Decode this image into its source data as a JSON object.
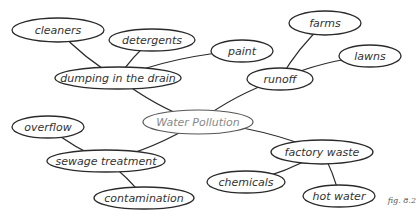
{
  "diagram": {
    "type": "mind-map",
    "center": {
      "id": "water-pollution",
      "label": "Water Pollution",
      "x": 198,
      "y": 122,
      "w": 110,
      "h": 24
    },
    "nodes": [
      {
        "id": "dumping",
        "label": "dumping in the drain",
        "x": 118,
        "y": 78,
        "w": 126,
        "h": 22
      },
      {
        "id": "cleaners",
        "label": "cleaners",
        "x": 58,
        "y": 30,
        "w": 92,
        "h": 24
      },
      {
        "id": "detergents",
        "label": "detergents",
        "x": 152,
        "y": 40,
        "w": 86,
        "h": 22
      },
      {
        "id": "paint",
        "label": "paint",
        "x": 242,
        "y": 51,
        "w": 62,
        "h": 22
      },
      {
        "id": "runoff",
        "label": "runoff",
        "x": 280,
        "y": 79,
        "w": 66,
        "h": 22
      },
      {
        "id": "farms",
        "label": "farms",
        "x": 325,
        "y": 23,
        "w": 72,
        "h": 24
      },
      {
        "id": "lawns",
        "label": "lawns",
        "x": 370,
        "y": 56,
        "w": 62,
        "h": 22
      },
      {
        "id": "sewage",
        "label": "sewage treatment",
        "x": 106,
        "y": 161,
        "w": 118,
        "h": 22
      },
      {
        "id": "overflow",
        "label": "overflow",
        "x": 48,
        "y": 127,
        "w": 72,
        "h": 22
      },
      {
        "id": "contamination",
        "label": "contamination",
        "x": 144,
        "y": 198,
        "w": 100,
        "h": 22
      },
      {
        "id": "factory",
        "label": "factory waste",
        "x": 322,
        "y": 152,
        "w": 102,
        "h": 24
      },
      {
        "id": "chemicals",
        "label": "chemicals",
        "x": 246,
        "y": 182,
        "w": 78,
        "h": 22
      },
      {
        "id": "hotwater",
        "label": "hot water",
        "x": 339,
        "y": 196,
        "w": 72,
        "h": 22
      }
    ],
    "edges": [
      [
        "water-pollution",
        "dumping"
      ],
      [
        "dumping",
        "cleaners"
      ],
      [
        "dumping",
        "detergents"
      ],
      [
        "dumping",
        "paint"
      ],
      [
        "water-pollution",
        "runoff"
      ],
      [
        "runoff",
        "farms"
      ],
      [
        "runoff",
        "lawns"
      ],
      [
        "water-pollution",
        "sewage"
      ],
      [
        "sewage",
        "overflow"
      ],
      [
        "sewage",
        "contamination"
      ],
      [
        "water-pollution",
        "factory"
      ],
      [
        "factory",
        "chemicals"
      ],
      [
        "factory",
        "hotwater"
      ]
    ]
  },
  "caption": "fig. 8.2"
}
